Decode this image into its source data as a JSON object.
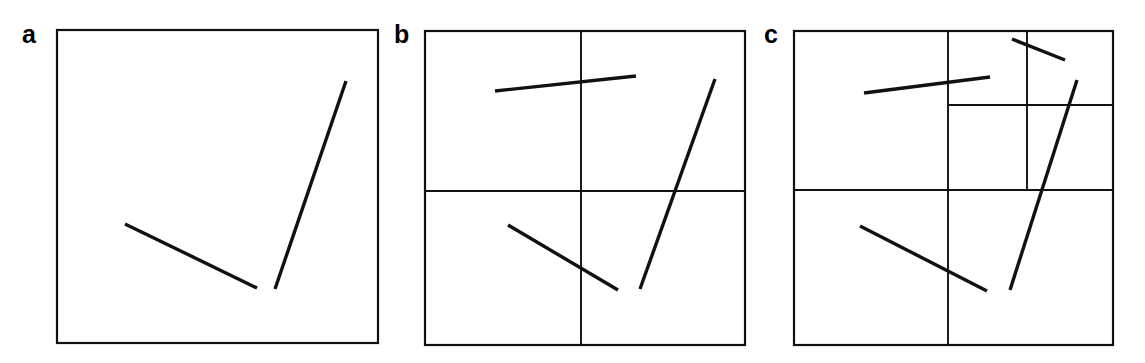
{
  "figure": {
    "background_color": "#ffffff",
    "ink_color": "#111111",
    "width": 1145,
    "height": 363
  },
  "panels": [
    {
      "id": "a",
      "label": "a",
      "label_x": 22,
      "label_y": 22,
      "frame": {
        "x": 57,
        "y": 30,
        "width": 321,
        "height": 313
      },
      "dividers": [],
      "segments": [
        {
          "name": "shallow-descending-segment",
          "x1": 125,
          "y1": 224,
          "x2": 257,
          "y2": 288
        },
        {
          "name": "steep-ascending-segment",
          "x1": 275,
          "y1": 289,
          "x2": 346,
          "y2": 81
        }
      ]
    },
    {
      "id": "b",
      "label": "b",
      "label_x": 394,
      "label_y": 22,
      "frame": {
        "x": 425,
        "y": 31,
        "width": 320,
        "height": 314
      },
      "dividers": [
        {
          "name": "vertical-divider",
          "x1": 581,
          "y1": 31,
          "x2": 581,
          "y2": 345
        },
        {
          "name": "horizontal-divider",
          "x1": 425,
          "y1": 191,
          "x2": 745,
          "y2": 191
        }
      ],
      "segments": [
        {
          "name": "shallow-rising-segment",
          "x1": 495,
          "y1": 91,
          "x2": 636,
          "y2": 76
        },
        {
          "name": "shallow-descending-segment",
          "x1": 508,
          "y1": 225,
          "x2": 618,
          "y2": 290
        },
        {
          "name": "steep-ascending-segment",
          "x1": 640,
          "y1": 289,
          "x2": 715,
          "y2": 79
        }
      ]
    },
    {
      "id": "c",
      "label": "c",
      "label_x": 764,
      "label_y": 22,
      "frame": {
        "x": 794,
        "y": 31,
        "width": 319,
        "height": 314
      },
      "dividers": [
        {
          "name": "main-vertical-divider",
          "x1": 948,
          "y1": 31,
          "x2": 948,
          "y2": 345
        },
        {
          "name": "main-horizontal-divider",
          "x1": 794,
          "y1": 190,
          "x2": 1113,
          "y2": 190
        },
        {
          "name": "upper-right-vertical-divider",
          "x1": 1027,
          "y1": 31,
          "x2": 1027,
          "y2": 190
        },
        {
          "name": "upper-right-horizontal-divider",
          "x1": 948,
          "y1": 105,
          "x2": 1113,
          "y2": 105
        }
      ],
      "segments": [
        {
          "name": "shallow-rising-segment",
          "x1": 864,
          "y1": 93,
          "x2": 990,
          "y2": 77
        },
        {
          "name": "short-descending-segment",
          "x1": 1012,
          "y1": 39,
          "x2": 1065,
          "y2": 60
        },
        {
          "name": "shallow-descending-segment",
          "x1": 860,
          "y1": 226,
          "x2": 987,
          "y2": 291
        },
        {
          "name": "steep-ascending-segment",
          "x1": 1010,
          "y1": 290,
          "x2": 1077,
          "y2": 80
        }
      ]
    }
  ]
}
